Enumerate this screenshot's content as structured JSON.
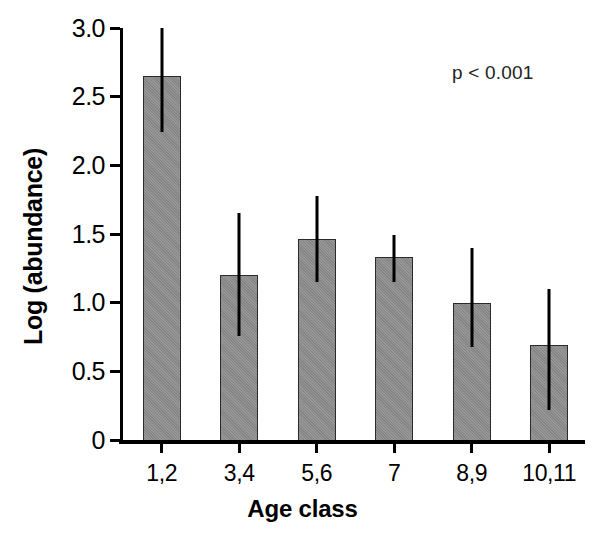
{
  "chart_data": {
    "type": "bar",
    "title": "",
    "xlabel": "Age class",
    "ylabel": "Log (abundance)",
    "categories": [
      "1,2",
      "3,4",
      "5,6",
      "7",
      "8,9",
      "10,11"
    ],
    "values": [
      2.65,
      1.2,
      1.46,
      1.33,
      1.0,
      0.69
    ],
    "error_bars": {
      "lower": [
        2.24,
        0.76,
        1.15,
        1.15,
        0.68,
        0.22
      ],
      "upper": [
        3.0,
        1.65,
        1.78,
        1.49,
        1.4,
        1.1
      ]
    },
    "ylim": [
      0,
      3.0
    ],
    "yticks": [
      0,
      0.5,
      1.0,
      1.5,
      2.0,
      2.5,
      3.0
    ],
    "ytick_labels": [
      "0",
      "0.5",
      "1.0",
      "1.5",
      "2.0",
      "2.5",
      "3.0"
    ],
    "grid": false,
    "legend": null,
    "annotations": [
      {
        "text": "p < 0.001",
        "position": "top-right"
      }
    ],
    "bar_color": "#8b8b8b",
    "bar_edge_color": "#2b2b2b",
    "errorbar_color": "#000000",
    "axis_color": "#000000"
  },
  "annotation_text": "p < 0.001"
}
